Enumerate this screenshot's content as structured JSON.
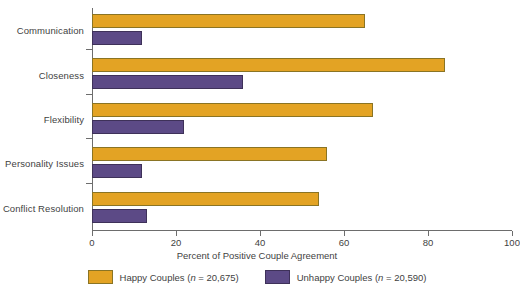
{
  "chart_data": {
    "type": "bar",
    "orientation": "horizontal",
    "title": "",
    "xlabel": "Percent of Positive Couple Agreement",
    "ylabel": "",
    "xlim": [
      0,
      100
    ],
    "xticks": [
      0,
      20,
      40,
      60,
      80,
      100
    ],
    "grid": false,
    "legend_position": "bottom",
    "categories": [
      "Communication",
      "Closeness",
      "Flexibility",
      "Personality Issues",
      "Conflict Resolution"
    ],
    "series": [
      {
        "name": "Happy Couples (n = 20,675)",
        "short_name": "Happy Couples",
        "n": "20,675",
        "color": "#e3a324",
        "values": [
          65,
          84,
          67,
          56,
          54
        ]
      },
      {
        "name": "Unhappy Couples (n = 20,590)",
        "short_name": "Unhappy Couples",
        "n": "20,590",
        "color": "#5c4a86",
        "values": [
          12,
          36,
          22,
          12,
          13
        ]
      }
    ]
  },
  "axis": {
    "x_title": "Percent of Positive Couple Agreement",
    "tick_labels": [
      "0",
      "20",
      "40",
      "60",
      "80",
      "100"
    ]
  },
  "legend": {
    "items": [
      {
        "label_prefix": "Happy Couples (",
        "n_equals": "n",
        "label_suffix": " = 20,675)",
        "full": "Happy Couples (n = 20,675)"
      },
      {
        "label_prefix": "Unhappy Couples (",
        "n_equals": "n",
        "label_suffix": " = 20,590)",
        "full": "Unhappy Couples (n = 20,590)"
      }
    ]
  },
  "categories": {
    "0": "Communication",
    "1": "Closeness",
    "2": "Flexibility",
    "3": "Personality Issues",
    "4": "Conflict Resolution"
  }
}
